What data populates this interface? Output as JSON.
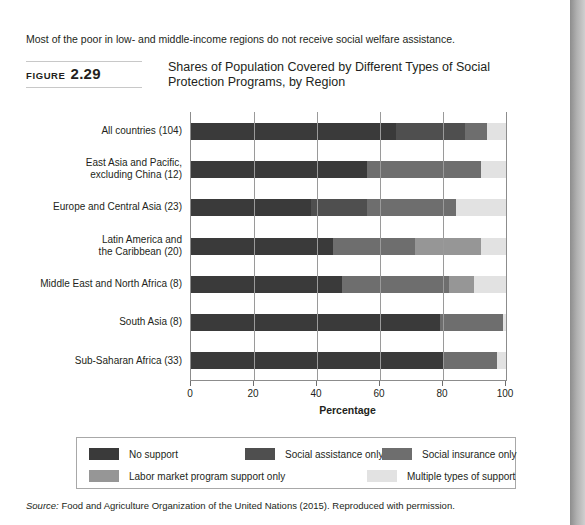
{
  "headline": "Most of the poor in low- and middle-income regions do not receive social welfare assistance.",
  "figure": {
    "label_word": "FIGURE",
    "label_number": "2.29",
    "title": "Shares of Population Covered by Different Types of Social Protection Programs, by Region"
  },
  "source": {
    "prefix": "Source:",
    "text": " Food and Agriculture Organization of the United Nations (2015). Reproduced with permission."
  },
  "chart_data": {
    "type": "bar",
    "orientation": "horizontal",
    "stacked": true,
    "title": "Shares of Population Covered by Different Types of Social Protection Programs, by Region",
    "xlabel": "Percentage",
    "ylabel": "",
    "xlim": [
      0,
      100
    ],
    "xticks": [
      0,
      20,
      40,
      60,
      80,
      100
    ],
    "xticklabels": [
      "0",
      "20",
      "40",
      "60",
      "80",
      "100"
    ],
    "grid": "vertical",
    "legend_position": "bottom",
    "categories": [
      "All countries (104)",
      "East Asia and Pacific, excluding China (12)",
      "Europe and Central Asia (23)",
      "Latin America and the Caribbean (20)",
      "Middle East and North Africa (8)",
      "South Asia (8)",
      "Sub-Saharan Africa (33)"
    ],
    "category_lines": [
      [
        "All countries (104)"
      ],
      [
        "East Asia and Pacific,",
        "excluding China (12)"
      ],
      [
        "Europe and Central Asia (23)"
      ],
      [
        "Latin America and",
        "the Caribbean (20)"
      ],
      [
        "Middle East and North Africa (8)"
      ],
      [
        "South Asia (8)"
      ],
      [
        "Sub-Saharan Africa (33)"
      ]
    ],
    "series": [
      {
        "name": "No support",
        "color": "#3a3a3a",
        "values": [
          65,
          56,
          38,
          45,
          48,
          79,
          80
        ]
      },
      {
        "name": "Social assistance only",
        "color": "#4f4f4f",
        "values": [
          22,
          0,
          18,
          0,
          0,
          0,
          0
        ]
      },
      {
        "name": "Social insurance only",
        "color": "#6e6e6e",
        "values": [
          7,
          36,
          28,
          26,
          34,
          20,
          17
        ]
      },
      {
        "name": "Labor market program support only",
        "color": "#969696",
        "values": [
          0,
          0,
          0,
          21,
          8,
          0,
          0
        ]
      },
      {
        "name": "Multiple types of support",
        "color": "#e2e2e2",
        "values": [
          6,
          8,
          16,
          8,
          10,
          1,
          3
        ]
      }
    ],
    "legend_entries": [
      {
        "label": "No support",
        "color": "#3a3a3a"
      },
      {
        "label": "Social assistance only",
        "color": "#4f4f4f"
      },
      {
        "label": "Social insurance only",
        "color": "#6e6e6e"
      },
      {
        "label": "Labor market program support only",
        "color": "#969696"
      },
      {
        "label": "Multiple types of support",
        "color": "#e2e2e2"
      }
    ]
  }
}
